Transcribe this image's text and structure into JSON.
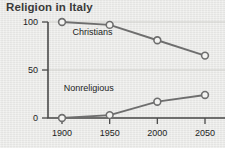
{
  "chart_data": {
    "type": "line",
    "title": "Religion in Italy",
    "xlabel": "",
    "ylabel": "",
    "x": [
      1900,
      1950,
      2000,
      2050
    ],
    "xtick_labels": [
      "1900",
      "1950",
      "2000",
      "2050"
    ],
    "ytick_labels": [
      "0",
      "50",
      "100"
    ],
    "yticks": [
      0,
      50,
      100
    ],
    "ylim": [
      0,
      100
    ],
    "xlim": [
      1900,
      2050
    ],
    "grid": "horizontal-light",
    "legend": "inline-labels",
    "marker": "open-circle",
    "line_color": "#6e6e6e",
    "marker_fill": "#f3f3f1",
    "background_color": "#e9e9e7",
    "title_color": "#3a3a3a",
    "series": [
      {
        "name": "Christians",
        "values": [
          100,
          97,
          81,
          65
        ],
        "label_x": 1932,
        "label_y": 86
      },
      {
        "name": "Nonreligious",
        "values": [
          0,
          3,
          17,
          24
        ],
        "label_x": 1928,
        "label_y": 28
      }
    ]
  }
}
